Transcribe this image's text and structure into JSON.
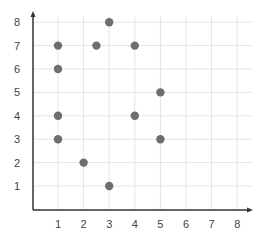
{
  "chart_data": {
    "type": "scatter",
    "title": "",
    "xlabel": "",
    "ylabel": "",
    "xlim": [
      0,
      8.6
    ],
    "ylim": [
      0,
      8.3
    ],
    "x_ticks": [
      "1",
      "2",
      "3",
      "4",
      "5",
      "6",
      "7",
      "8"
    ],
    "y_ticks": [
      "1",
      "2",
      "3",
      "4",
      "5",
      "6",
      "7",
      "8"
    ],
    "grid": true,
    "legend": null,
    "series": [
      {
        "name": "points",
        "color": "#707070",
        "points": [
          {
            "x": 3,
            "y": 8
          },
          {
            "x": 1,
            "y": 7
          },
          {
            "x": 2.5,
            "y": 7
          },
          {
            "x": 4,
            "y": 7
          },
          {
            "x": 1,
            "y": 6
          },
          {
            "x": 5,
            "y": 5
          },
          {
            "x": 1,
            "y": 4
          },
          {
            "x": 4,
            "y": 4
          },
          {
            "x": 1,
            "y": 3
          },
          {
            "x": 5,
            "y": 3
          },
          {
            "x": 2,
            "y": 2
          },
          {
            "x": 3,
            "y": 1
          }
        ]
      }
    ]
  },
  "style": {
    "axis_color": "#333333",
    "grid_color": "#e4e4e4",
    "point_color": "#6e6e6e"
  }
}
